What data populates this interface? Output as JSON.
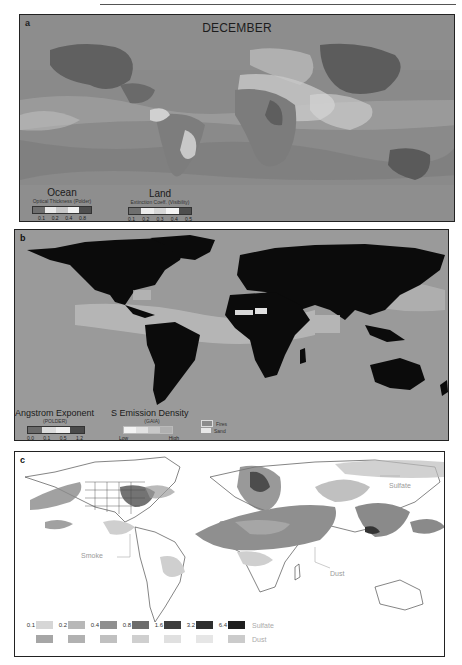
{
  "panels": {
    "a": {
      "label": "a",
      "title": "DECEMBER",
      "legend_ocean": {
        "title": "Ocean",
        "subtitle": "Optical Thickness (Polder)",
        "ticks": [
          "0.1",
          "0.2",
          "0.4",
          "0.8"
        ],
        "colors": [
          "#6f6f6f",
          "#e9e9e9",
          "#c8c8c8",
          "#f2f2f2",
          "#4e4e4e"
        ]
      },
      "legend_land": {
        "title": "Land",
        "subtitle": "Extinction Coeff. (Visibility)",
        "ticks": [
          "0.1",
          "0.2",
          "0.3",
          "0.4",
          "0.5"
        ],
        "colors": [
          "#6f6f6f",
          "#ececec",
          "#d7d7d7",
          "#f4f4f4",
          "#4e4e4e"
        ]
      }
    },
    "b": {
      "label": "b",
      "legend_angstrom": {
        "title": "Angstrom Exponent",
        "subtitle": "(POLDER)",
        "ticks": [
          "0.0",
          "0.1",
          "0.5",
          "1.2"
        ],
        "colors": [
          "#6a6a6a",
          "#dcdcdc",
          "#f0f0f0",
          "#4a4a4a"
        ]
      },
      "legend_emission": {
        "title": "S Emission Density",
        "subtitle": "(GAIA)",
        "tick_low": "Low",
        "tick_high": "High",
        "colors": [
          "#f4f4f4",
          "#e2e2e2",
          "#c8c8c8",
          "#b0b0b0"
        ]
      },
      "legend_types": [
        {
          "label": "Fires",
          "swatch": "#8c8c8c"
        },
        {
          "label": "Sand",
          "swatch": "#e8e8e8"
        }
      ]
    },
    "c": {
      "label": "c",
      "annotations": {
        "sulfate": "Sulfate",
        "smoke": "Smoke",
        "dust": "Dust"
      },
      "legend": {
        "values": [
          "0.1",
          "0.2",
          "0.4",
          "0.8",
          "1.6",
          "3.2",
          "6.4"
        ],
        "sulfate_label": "Sulfate",
        "dust_label": "Dust",
        "sulfate_colors": [
          "#d6d6d6",
          "#b8b8b8",
          "#8f8f8f",
          "#6d6d6d",
          "#3e3e3e",
          "#2e2e2e",
          "#1f1f1f"
        ],
        "dust_colors": [
          "#a6a6a6",
          "#b1b1b1",
          "#c0c0c0",
          "#cfcfcf",
          "#e0e0e0",
          "#e6e6e6",
          "#cbcbcb"
        ]
      }
    }
  }
}
